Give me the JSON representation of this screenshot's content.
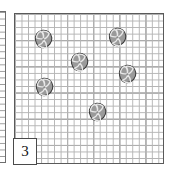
{
  "board": {
    "name": "shell-puzzle-grid",
    "left": 14,
    "top": 13,
    "width": 150,
    "height": 151,
    "minor_cell_px": 6.52,
    "major_cell_px": 26.1,
    "minor_line_color": "#b4b4b4",
    "major_line_color": "#6a6a6a",
    "border_color": "#5a5a5a",
    "background_color": "#ffffff"
  },
  "neighbor_panel": {
    "name": "adjacent-panel-clipped",
    "visible_width": 6,
    "border_color": "#6e6e6e"
  },
  "clue": {
    "label": "3",
    "left": 13,
    "top": 138,
    "width": 24,
    "height": 27,
    "text_color": "#111111",
    "background_color": "#ffffff",
    "border_color": "#4a4a4a"
  },
  "piece_style": {
    "icon": "shell-icon",
    "fill_color": "#9a9a9a",
    "outline_color": "#3c3c3c",
    "swirl_color": "#e8e8e8",
    "diameter_px": 20
  },
  "pieces": [
    {
      "id": "shell-1",
      "left": 33,
      "top": 29
    },
    {
      "id": "shell-2",
      "left": 107,
      "top": 27
    },
    {
      "id": "shell-3",
      "left": 69,
      "top": 52
    },
    {
      "id": "shell-4",
      "left": 117,
      "top": 64
    },
    {
      "id": "shell-5",
      "left": 34,
      "top": 77
    },
    {
      "id": "shell-6",
      "left": 87,
      "top": 102
    }
  ]
}
